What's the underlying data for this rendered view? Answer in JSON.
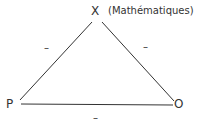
{
  "diagram": {
    "type": "triangle",
    "vertices": {
      "top": {
        "label": "X",
        "note": "(Mathématiques)"
      },
      "left": {
        "label": "P"
      },
      "right": {
        "label": "O"
      }
    },
    "edges": [
      {
        "from": "P",
        "to": "X",
        "sign": "–"
      },
      {
        "from": "X",
        "to": "O",
        "sign": "–"
      },
      {
        "from": "P",
        "to": "O",
        "sign": "–"
      }
    ],
    "line_color": "#333333"
  }
}
